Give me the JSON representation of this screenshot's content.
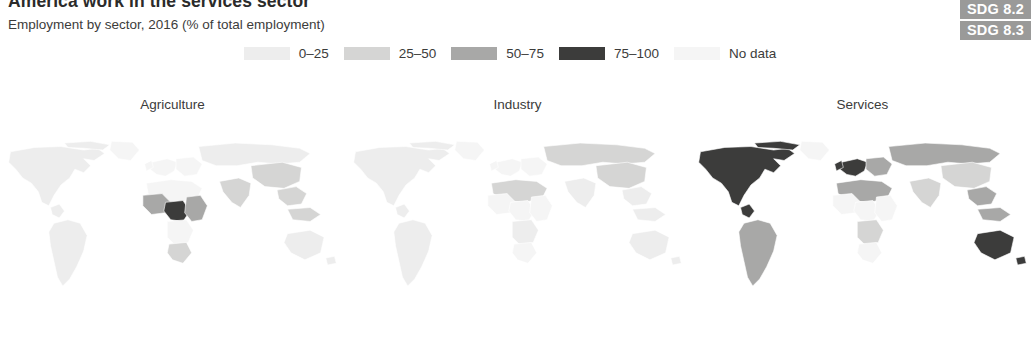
{
  "header": {
    "title": "America work in the services sector",
    "subtitle": "Employment by sector, 2016 (% of total employment)"
  },
  "sdg_badges": [
    {
      "label": "SDG 8.2"
    },
    {
      "label": "SDG 8.3"
    }
  ],
  "legend": {
    "items": [
      {
        "label": "0–25",
        "color": "#ededed"
      },
      {
        "label": "25–50",
        "color": "#d5d5d4"
      },
      {
        "label": "50–75",
        "color": "#a8a8a7"
      },
      {
        "label": "75–100",
        "color": "#3c3c3b"
      },
      {
        "label": "No data",
        "color": "#f5f5f5"
      }
    ]
  },
  "chart_data": {
    "type": "map",
    "title": "America work in the services sector",
    "subtitle": "Employment by sector, 2016 (% of total employment)",
    "unit": "% of total employment",
    "year": 2016,
    "legend_position": "top-center",
    "bins": [
      "0–25",
      "25–50",
      "50–75",
      "75–100",
      "No data"
    ],
    "bin_colors": [
      "#ededed",
      "#d5d5d4",
      "#a8a8a7",
      "#3c3c3b",
      "#f5f5f5"
    ],
    "panels": [
      {
        "title": "Agriculture",
        "regions": [
          {
            "name": "North America",
            "bin": "0–25"
          },
          {
            "name": "South America",
            "bin": "0–25"
          },
          {
            "name": "Europe",
            "bin": "0–25"
          },
          {
            "name": "Russia",
            "bin": "0–25"
          },
          {
            "name": "West Africa",
            "bin": "50–75"
          },
          {
            "name": "Central Africa",
            "bin": "75–100"
          },
          {
            "name": "East Africa",
            "bin": "50–75"
          },
          {
            "name": "Southern Africa",
            "bin": "25–50"
          },
          {
            "name": "South Asia",
            "bin": "25–50"
          },
          {
            "name": "China",
            "bin": "25–50"
          },
          {
            "name": "Southeast Asia",
            "bin": "25–50"
          },
          {
            "name": "Australia",
            "bin": "0–25"
          }
        ]
      },
      {
        "title": "Industry",
        "regions": [
          {
            "name": "North America",
            "bin": "0–25"
          },
          {
            "name": "South America",
            "bin": "0–25"
          },
          {
            "name": "Europe",
            "bin": "25–50"
          },
          {
            "name": "Russia",
            "bin": "25–50"
          },
          {
            "name": "North Africa",
            "bin": "25–50"
          },
          {
            "name": "Sub-Saharan Africa",
            "bin": "0–25"
          },
          {
            "name": "South Asia",
            "bin": "0–25"
          },
          {
            "name": "China",
            "bin": "25–50"
          },
          {
            "name": "Southeast Asia",
            "bin": "0–25"
          },
          {
            "name": "Australia",
            "bin": "0–25"
          }
        ]
      },
      {
        "title": "Services",
        "regions": [
          {
            "name": "North America",
            "bin": "75–100"
          },
          {
            "name": "South America",
            "bin": "50–75"
          },
          {
            "name": "Western Europe",
            "bin": "75–100"
          },
          {
            "name": "Eastern Europe",
            "bin": "50–75"
          },
          {
            "name": "Russia",
            "bin": "50–75"
          },
          {
            "name": "North Africa",
            "bin": "50–75"
          },
          {
            "name": "Sub-Saharan Africa",
            "bin": "25–50"
          },
          {
            "name": "South Asia",
            "bin": "25–50"
          },
          {
            "name": "China",
            "bin": "25–50"
          },
          {
            "name": "Southeast Asia",
            "bin": "50–75"
          },
          {
            "name": "Australia",
            "bin": "75–100"
          }
        ]
      }
    ]
  }
}
